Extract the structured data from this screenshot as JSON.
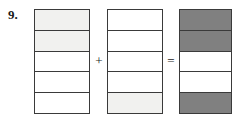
{
  "problem": {
    "number_label": "9.",
    "operator_add": "+",
    "operator_equals": "="
  },
  "colors": {
    "stroke": "#3a3a3a",
    "fill_white": "#ffffff",
    "fill_light": "#f1f1ef",
    "fill_dark": "#808080",
    "background": "#ffffff",
    "text": "#1a1a1a"
  },
  "chart_data": {
    "type": "bar",
    "title": "",
    "xlabel": "",
    "ylabel": "",
    "grid": false,
    "legend": "none",
    "cells_per_bar": 5,
    "categories": [
      "addend-1",
      "addend-2",
      "sum"
    ],
    "values": [
      2,
      1,
      3
    ],
    "series": [
      {
        "name": "addend-1",
        "fraction": "2/5",
        "shaded_count": 2,
        "cells": [
          "light",
          "light",
          "white",
          "white",
          "white"
        ]
      },
      {
        "name": "addend-2",
        "fraction": "1/5",
        "shaded_count": 1,
        "cells": [
          "white",
          "white",
          "white",
          "white",
          "light"
        ]
      },
      {
        "name": "sum",
        "fraction": "3/5",
        "shaded_count": 3,
        "cells": [
          "dark",
          "dark",
          "white",
          "white",
          "dark"
        ]
      }
    ]
  }
}
